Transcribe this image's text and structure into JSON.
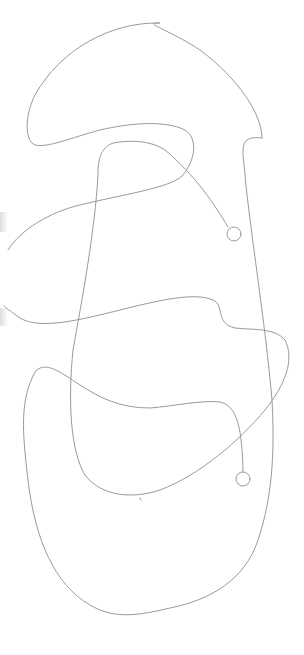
{
  "canvas": {
    "width": 304,
    "height": 655,
    "background": "#ffffff",
    "stroke_color": "#9a9a9a"
  },
  "drawing": {
    "description": "Continuous single-line maze-like path drawing with two small circle endpoints",
    "endpoints": [
      {
        "name": "upper-circle",
        "cx": 234,
        "cy": 234,
        "r": 7
      },
      {
        "name": "lower-circle",
        "cx": 243,
        "cy": 479,
        "r": 7
      }
    ]
  }
}
